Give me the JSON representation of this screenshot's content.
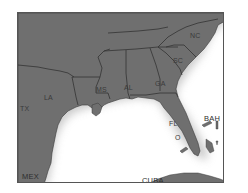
{
  "map": {
    "region": "Southeastern United States and Gulf of Mexico",
    "colors": {
      "land": "#6f6f6f",
      "border": "#3a3a3a",
      "water": "#ffffff",
      "frame": "#555555",
      "shadow": "#bdbdbd"
    },
    "state_labels": [
      {
        "id": "nc",
        "text": "NC"
      },
      {
        "id": "sc",
        "text": "SC"
      },
      {
        "id": "ga",
        "text": "GA"
      },
      {
        "id": "al",
        "text": "AL"
      },
      {
        "id": "ms",
        "text": "MS"
      },
      {
        "id": "la",
        "text": "LA"
      },
      {
        "id": "tx",
        "text": "TX"
      },
      {
        "id": "fl",
        "text": "FL"
      },
      {
        "id": "fl_o",
        "text": "O"
      }
    ],
    "country_labels": [
      {
        "id": "mex",
        "text": "MEX"
      },
      {
        "id": "cuba",
        "text": "CUBA"
      },
      {
        "id": "bah",
        "text": "BAH"
      }
    ]
  }
}
